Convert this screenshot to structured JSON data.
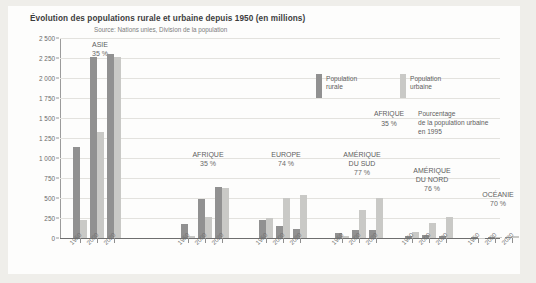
{
  "chart_data": {
    "type": "bar",
    "title": "Évolution des populations rurale et urbaine depuis 1950 (en millions)",
    "subtitle": "Source: Nations unies, Division de la population",
    "xlabel": "",
    "ylabel": "",
    "ylim": [
      0,
      2500
    ],
    "grid": true,
    "legend_position": "top-right",
    "ytick_labels": [
      "2 500",
      "2 250",
      "2 000",
      "1 750",
      "1 500",
      "1 250",
      "1 000",
      "750",
      "500",
      "250",
      "0"
    ],
    "ytick_values": [
      2500,
      2250,
      2000,
      1750,
      1500,
      1250,
      1000,
      750,
      500,
      250,
      0
    ],
    "categories": [
      "1950",
      "2000",
      "2020"
    ],
    "series": [
      {
        "name": "Population rurale",
        "color": "#919191"
      },
      {
        "name": "Population urbaine",
        "color": "#c9c9c6"
      }
    ],
    "groups": [
      {
        "name": "ASIE",
        "label_lines": [
          "ASIE"
        ],
        "percent": "35 %",
        "rural": [
          1140,
          2260,
          2300
        ],
        "urbaine": [
          230,
          1330,
          2260
        ]
      },
      {
        "name": "AFRIQUE",
        "label_lines": [
          "AFRIQUE"
        ],
        "percent": "35 %",
        "rural": [
          175,
          490,
          640
        ],
        "urbaine": [
          20,
          265,
          620
        ]
      },
      {
        "name": "EUROPE",
        "label_lines": [
          "EUROPE"
        ],
        "percent": "74 %",
        "rural": [
          230,
          155,
          115
        ],
        "urbaine": [
          245,
          505,
          535
        ]
      },
      {
        "name": "AMÉRIQUE DU SUD",
        "label_lines": [
          "AMÉRIQUE",
          "DU SUD"
        ],
        "percent": "77 %",
        "rural": [
          65,
          105,
          105
        ],
        "urbaine": [
          30,
          355,
          505
        ]
      },
      {
        "name": "AMÉRIQUE DU NORD",
        "label_lines": [
          "AMÉRIQUE",
          "DU NORD"
        ],
        "percent": "76 %",
        "rural": [
          25,
          35,
          30
        ],
        "urbaine": [
          70,
          190,
          260
        ]
      },
      {
        "name": "OCÉANIE",
        "label_lines": [
          "OCÉANIE"
        ],
        "percent": "70 %",
        "rural": [
          8,
          9,
          9
        ],
        "urbaine": [
          5,
          16,
          22
        ]
      }
    ],
    "annotation": {
      "key_region": "AFRIQUE",
      "key_percent": "35 %",
      "description_lines": [
        "Pourcentage",
        "de la population urbaine",
        "en 1995"
      ]
    }
  },
  "colors": {
    "page_background": "#efeeea",
    "card_background": "#fdfdfc",
    "rural": "#919191",
    "urbaine": "#c9c9c6",
    "gridline": "#e3e2de",
    "axis": "#6e6e6e",
    "text": "#5e5e5e"
  }
}
